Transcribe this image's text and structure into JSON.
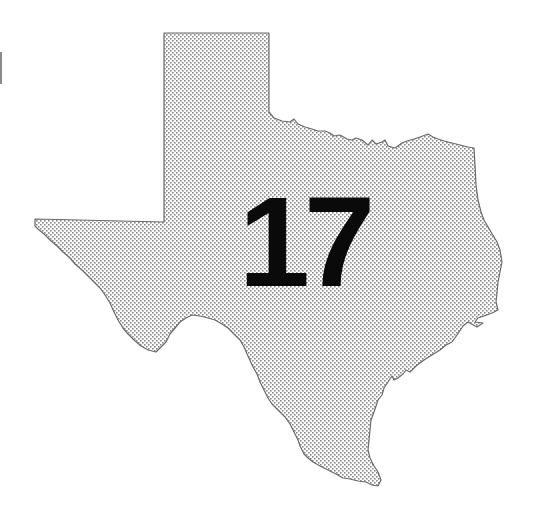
{
  "map": {
    "region": "Texas",
    "shape": "state-outline",
    "fill_pattern": "dot-stipple",
    "colors": {
      "background": "#ffffff",
      "dots": "#8a8a8a",
      "outline": "#666666",
      "label": "#0a0a0a"
    },
    "label": "17"
  }
}
